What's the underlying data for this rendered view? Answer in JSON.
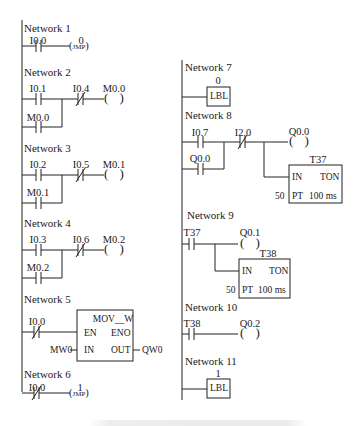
{
  "left_column": {
    "network1": {
      "label": "Network 1",
      "contact": "I0.0",
      "jmp_n": "0",
      "coil": "JMP"
    },
    "network2": {
      "label": "Network 2",
      "contact_a": "I0.1",
      "contact_b": "M0.0",
      "contact_nc": "I0.4",
      "coil": "M0.0"
    },
    "network3": {
      "label": "Network 3",
      "contact_a": "I0.2",
      "contact_b": "M0.1",
      "contact_nc": "I0.5",
      "coil": "M0.1"
    },
    "network4": {
      "label": "Network 4",
      "contact_a": "I0.3",
      "contact_b": "M0.2",
      "contact_nc": "I0.6",
      "coil": "M0.2"
    },
    "network5": {
      "label": "Network 5",
      "contact_nc": "I0.0",
      "block": "MOV__W",
      "en": "EN",
      "eno": "ENO",
      "in_pin": "IN",
      "out_pin": "OUT",
      "in_val": "MW0",
      "out_val": "QW0"
    },
    "network6": {
      "label": "Network 6",
      "contact_nc": "I0.0",
      "jmp_n": "1",
      "coil": "JMP"
    }
  },
  "right_column": {
    "network7": {
      "label": "Network 7",
      "lbl_n": "0",
      "box": "LBL"
    },
    "network8": {
      "label": "Network 8",
      "contact_a": "I0.7",
      "contact_b": "Q0.0",
      "contact_nc": "I2.0",
      "coil": "Q0.0",
      "timer": "T37",
      "timer_in": "IN",
      "timer_type": "TON",
      "pt_val": "50",
      "pt": "PT",
      "base": "100 ms"
    },
    "network9": {
      "label": "Network 9",
      "contact": "T37",
      "coil": "Q0.1",
      "timer": "T38",
      "timer_in": "IN",
      "timer_type": "TON",
      "pt_val": "50",
      "pt": "PT",
      "base": "100 ms"
    },
    "network10": {
      "label": "Network 10",
      "contact": "T38",
      "coil": "Q0.2"
    },
    "network11": {
      "label": "Network 11",
      "lbl_n": "1",
      "box": "LBL"
    }
  }
}
